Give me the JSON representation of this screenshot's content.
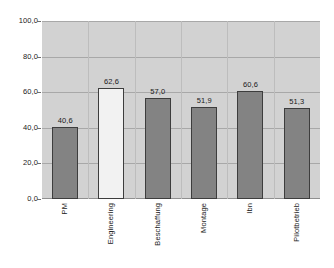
{
  "chart_data": {
    "type": "bar",
    "title": "",
    "subtitle": "",
    "xlabel": "",
    "ylabel": "",
    "categories": [
      "PM",
      "Engineering",
      "Beschaffung",
      "Montage",
      "Ibn",
      "Pilotbetrieb"
    ],
    "values": [
      40.6,
      62.6,
      57.0,
      51.9,
      60.6,
      51.3
    ],
    "value_labels": [
      "40,6",
      "62,6",
      "57,0",
      "51,9",
      "60,6",
      "51,3"
    ],
    "ylim": [
      0,
      100
    ],
    "ytick_values": [
      100,
      80,
      60,
      40,
      20,
      0
    ],
    "ytick_labels": [
      "100,0",
      "80,0",
      "60,0",
      "40,0",
      "20,0",
      "0,0"
    ],
    "grid": {
      "horizontal": true,
      "vertical": true
    },
    "legend": {
      "visible": false,
      "position": "none"
    },
    "bar_styles": [
      {
        "fill": "#838383",
        "border": "#3d3d3d"
      },
      {
        "fill": "#f2f2f2",
        "border": "#3d3d3d"
      },
      {
        "fill": "#838383",
        "border": "#3d3d3d"
      },
      {
        "fill": "#838383",
        "border": "#3d3d3d"
      },
      {
        "fill": "#838383",
        "border": "#3d3d3d"
      },
      {
        "fill": "#838383",
        "border": "#3d3d3d"
      }
    ],
    "colors": {
      "plot_background": "#d2d2d2",
      "page_background": "#ffffff",
      "gridline_horizontal": "#a8a8a8",
      "gridline_vertical": "#bdbdbd",
      "axis": "#8f8f8f",
      "text": "#1a1a1a"
    },
    "xtick_label_rotation": 90
  }
}
